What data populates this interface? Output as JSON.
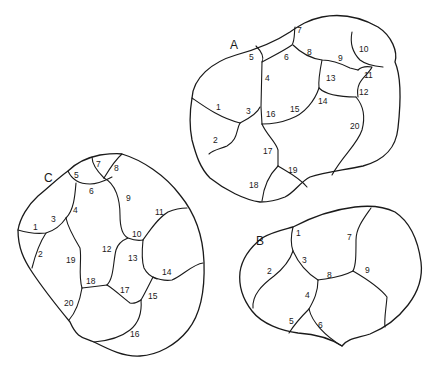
{
  "diagram": {
    "title": "",
    "shapes": [
      {
        "id": "A",
        "label": "A",
        "regions": [
          "1",
          "2",
          "3",
          "4",
          "5",
          "6",
          "7",
          "8",
          "9",
          "10",
          "11",
          "12",
          "13",
          "14",
          "15",
          "16",
          "17",
          "18",
          "19",
          "20"
        ]
      },
      {
        "id": "B",
        "label": "B",
        "regions": [
          "1",
          "2",
          "3",
          "4",
          "5",
          "6",
          "7",
          "8",
          "9"
        ]
      },
      {
        "id": "C",
        "label": "C",
        "regions": [
          "1",
          "2",
          "3",
          "4",
          "5",
          "6",
          "7",
          "8",
          "9",
          "10",
          "11",
          "12",
          "13",
          "14",
          "15",
          "16",
          "17",
          "18",
          "19",
          "20"
        ]
      }
    ],
    "colors": {
      "stroke": "#1a1a1a",
      "background": "#ffffff"
    }
  },
  "A": {
    "label": "A",
    "r": {
      "1": "1",
      "2": "2",
      "3": "3",
      "4": "4",
      "5": "5",
      "6": "6",
      "7": "7",
      "8": "8",
      "9": "9",
      "10": "10",
      "11": "11",
      "12": "12",
      "13": "13",
      "14": "14",
      "15": "15",
      "16": "16",
      "17": "17",
      "18": "18",
      "19": "19",
      "20": "20"
    }
  },
  "B": {
    "label": "B",
    "r": {
      "1": "1",
      "2": "2",
      "3": "3",
      "4": "4",
      "5": "5",
      "6": "6",
      "7": "7",
      "8": "8",
      "9": "9"
    }
  },
  "C": {
    "label": "C",
    "r": {
      "1": "1",
      "2": "2",
      "3": "3",
      "4": "4",
      "5": "5",
      "6": "6",
      "7": "7",
      "8": "8",
      "9": "9",
      "10": "10",
      "11": "11",
      "12": "12",
      "13": "13",
      "14": "14",
      "15": "15",
      "16": "16",
      "17": "17",
      "18": "18",
      "19": "19",
      "20": "20"
    }
  }
}
